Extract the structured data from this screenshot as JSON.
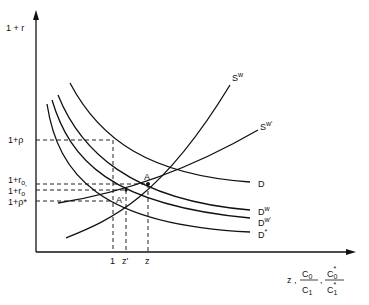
{
  "axes": {
    "y_label": "1 + r",
    "x_label_z": "z ,",
    "x_frac1_num": "C",
    "x_frac1_num_sub": "0",
    "x_frac1_den": "C",
    "x_frac1_den_sub": "1",
    "x_sep": ",",
    "x_frac2_num": "C",
    "x_frac2_num_sub": "0",
    "x_frac2_num_sup": "*",
    "x_frac2_den": "C",
    "x_frac2_den_sub": "1",
    "x_frac2_den_sup": "*"
  },
  "y_ticks": {
    "rho": "1+ρ",
    "r0": "1+r",
    "r0_sub": "o",
    "r0p": "1+r",
    "r0p_sub": "o",
    "r0p_sup": "'",
    "rhostar": "1+ρ*"
  },
  "x_ticks": {
    "one": "1",
    "zprime": "z'",
    "z": "z"
  },
  "curve_labels": {
    "Sw": "S",
    "Sw_sup": "w",
    "Swp": "S",
    "Swp_sup": "w'",
    "D": "D",
    "Dw": "D",
    "Dw_sup": "w",
    "Dwp": "D",
    "Dwp_sup": "w'",
    "Dstar": "D",
    "Dstar_sup": "*"
  },
  "points": {
    "A": "A",
    "Aprime": "A'"
  }
}
